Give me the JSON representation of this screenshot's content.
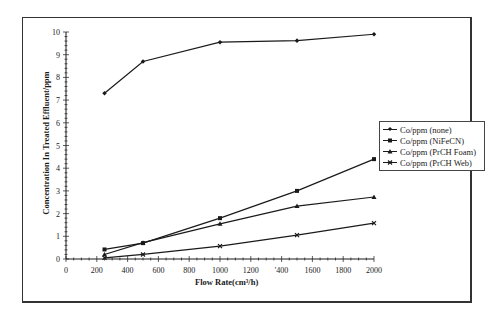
{
  "chart_data": {
    "type": "line",
    "title": "",
    "xlabel": "Flow Rate(cm³/h)",
    "ylabel": "Concentration In Treated Effluent/ppm",
    "xlim": [
      0,
      2000
    ],
    "ylim": [
      0,
      10
    ],
    "x_ticks": [
      "0",
      "200",
      "400",
      "600",
      "800",
      "1000",
      "1200",
      "'400",
      "1600",
      "1800",
      "2000"
    ],
    "y_ticks": [
      "0",
      "1",
      "2",
      "3",
      "4",
      "5",
      "6",
      "7",
      "8",
      "9",
      "10"
    ],
    "grid": false,
    "legend_position": "right",
    "x": [
      250,
      500,
      1000,
      1500,
      2000
    ],
    "series": [
      {
        "name": "Co/ppm (none)",
        "marker": "diamond",
        "values": [
          7.3,
          8.7,
          9.55,
          9.62,
          9.9
        ]
      },
      {
        "name": "Co/ppm (NiFeCN)",
        "marker": "square",
        "values": [
          0.42,
          0.7,
          1.8,
          3.0,
          4.4
        ]
      },
      {
        "name": "Co/ppm (PrCH Foam)",
        "marker": "triangle",
        "values": [
          0.2,
          0.72,
          1.55,
          2.33,
          2.73
        ]
      },
      {
        "name": "Co/ppm (PrCH Web)",
        "marker": "x",
        "values": [
          0.05,
          0.2,
          0.57,
          1.05,
          1.58
        ]
      }
    ]
  },
  "legend": {
    "items": [
      "Co/ppm (none)",
      "Co/ppm (NiFeCN)",
      "Co/ppm (PrCH Foam)",
      "Co/ppm (PrCH Web)"
    ]
  },
  "axes": {
    "xlabel": "Flow Rate(cm³/h)",
    "ylabel": "Concentration In Treated Effluent/ppm"
  },
  "colors": {
    "line": "#1a1a1a",
    "frame": "#333333",
    "background": "#ffffff"
  }
}
